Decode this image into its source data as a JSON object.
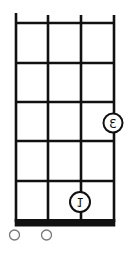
{
  "chord_diagram": {
    "orientation": "mirrored-vertical (nut at bottom)",
    "strings": 4,
    "frets": 5,
    "colors": {
      "line": "#111111",
      "background": "#ffffff",
      "open_marker": "#777777"
    },
    "fingers": [
      {
        "string": 4,
        "fret": 3,
        "label": "3"
      },
      {
        "string": 3,
        "fret": 1,
        "label": "1"
      }
    ],
    "open_strings": [
      1,
      2
    ]
  }
}
